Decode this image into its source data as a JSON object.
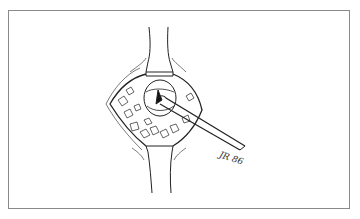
{
  "figure": {
    "signature": "JR 86",
    "border_color": "#8a8a8a",
    "ink_color": "#222222"
  }
}
